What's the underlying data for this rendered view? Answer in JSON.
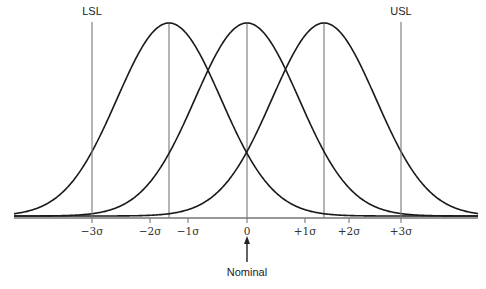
{
  "chart_data": {
    "type": "line",
    "title": "",
    "xlabel": "",
    "ylabel": "",
    "ticks": [
      {
        "label": "−3σ",
        "x": 92
      },
      {
        "label": "−2σ",
        "x": 150
      },
      {
        "label": "−1σ",
        "x": 188
      },
      {
        "label": "0",
        "x": 247
      },
      {
        "label": "+1σ",
        "x": 305
      },
      {
        "label": "+2σ",
        "x": 349
      },
      {
        "label": "+3σ",
        "x": 401
      }
    ],
    "series": [
      {
        "name": "shifted -1.5 sigma",
        "mean_sigma": -1.5,
        "center_x": 169
      },
      {
        "name": "nominal",
        "mean_sigma": 0,
        "center_x": 247
      },
      {
        "name": "shifted +1.5 sigma",
        "mean_sigma": 1.5,
        "center_x": 324
      }
    ],
    "spec_limits": [
      {
        "label": "LSL",
        "sigma": -3,
        "x": 92
      },
      {
        "label": "USL",
        "sigma": 3,
        "x": 401
      }
    ],
    "annotations": [
      {
        "text": "Nominal",
        "points_to": "0"
      }
    ],
    "grid": false,
    "legend": "none"
  },
  "layout": {
    "baseline_y": 218,
    "peak_y": 23,
    "x_start": 14,
    "x_end": 478,
    "sigma_px": 52
  },
  "labels": {
    "lsl": "LSL",
    "usl": "USL",
    "nominal": "Nominal"
  }
}
